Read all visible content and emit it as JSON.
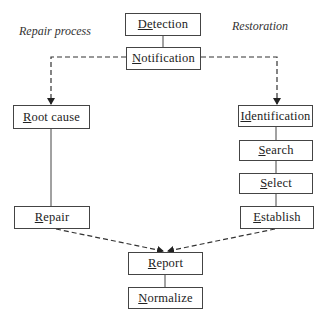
{
  "diagram": {
    "section_labels": {
      "left": "Repair process",
      "right": "Restoration"
    },
    "nodes": [
      {
        "id": "detection",
        "label": "Detection",
        "underline": "De",
        "rest": "tection"
      },
      {
        "id": "notification",
        "label": "Notification",
        "underline": "N",
        "rest": "otification"
      },
      {
        "id": "root_cause",
        "label": "Root cause",
        "underline": "R",
        "rest": "oot cause"
      },
      {
        "id": "repair",
        "label": "Repair",
        "underline": "R",
        "rest": "epair"
      },
      {
        "id": "identification",
        "label": "Identification",
        "underline": "Id",
        "rest": "entification"
      },
      {
        "id": "search",
        "label": "Search",
        "underline": "S",
        "rest": "earch"
      },
      {
        "id": "select",
        "label": "Select",
        "underline": "S",
        "rest": "elect"
      },
      {
        "id": "establish",
        "label": "Establish",
        "underline": "E",
        "rest": "stablish"
      },
      {
        "id": "report",
        "label": "Report",
        "underline": "R",
        "rest": "eport"
      },
      {
        "id": "normalize",
        "label": "Normalize",
        "underline": "N",
        "rest": "ormalize"
      }
    ],
    "edges": [
      {
        "from": "detection",
        "to": "notification",
        "style": "solid"
      },
      {
        "from": "notification",
        "to": "root_cause",
        "style": "dashed-arrow"
      },
      {
        "from": "notification",
        "to": "identification",
        "style": "dashed-arrow"
      },
      {
        "from": "root_cause",
        "to": "repair",
        "style": "solid"
      },
      {
        "from": "identification",
        "to": "search",
        "style": "solid"
      },
      {
        "from": "search",
        "to": "select",
        "style": "solid"
      },
      {
        "from": "select",
        "to": "establish",
        "style": "solid"
      },
      {
        "from": "repair",
        "to": "report",
        "style": "dashed-arrow"
      },
      {
        "from": "establish",
        "to": "report",
        "style": "dashed-arrow"
      },
      {
        "from": "report",
        "to": "normalize",
        "style": "solid"
      }
    ]
  }
}
